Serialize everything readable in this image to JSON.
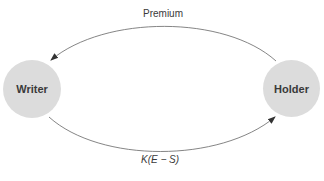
{
  "diagram": {
    "nodes": [
      {
        "id": "writer",
        "label": "Writer"
      },
      {
        "id": "holder",
        "label": "Holder"
      }
    ],
    "edges": [
      {
        "from": "holder",
        "to": "writer",
        "label": "Premium"
      },
      {
        "from": "writer",
        "to": "holder",
        "label": "K(E − S)"
      }
    ],
    "colors": {
      "node_fill": "#dcdcdc",
      "line": "#555555",
      "text": "#3a3a3a"
    }
  }
}
